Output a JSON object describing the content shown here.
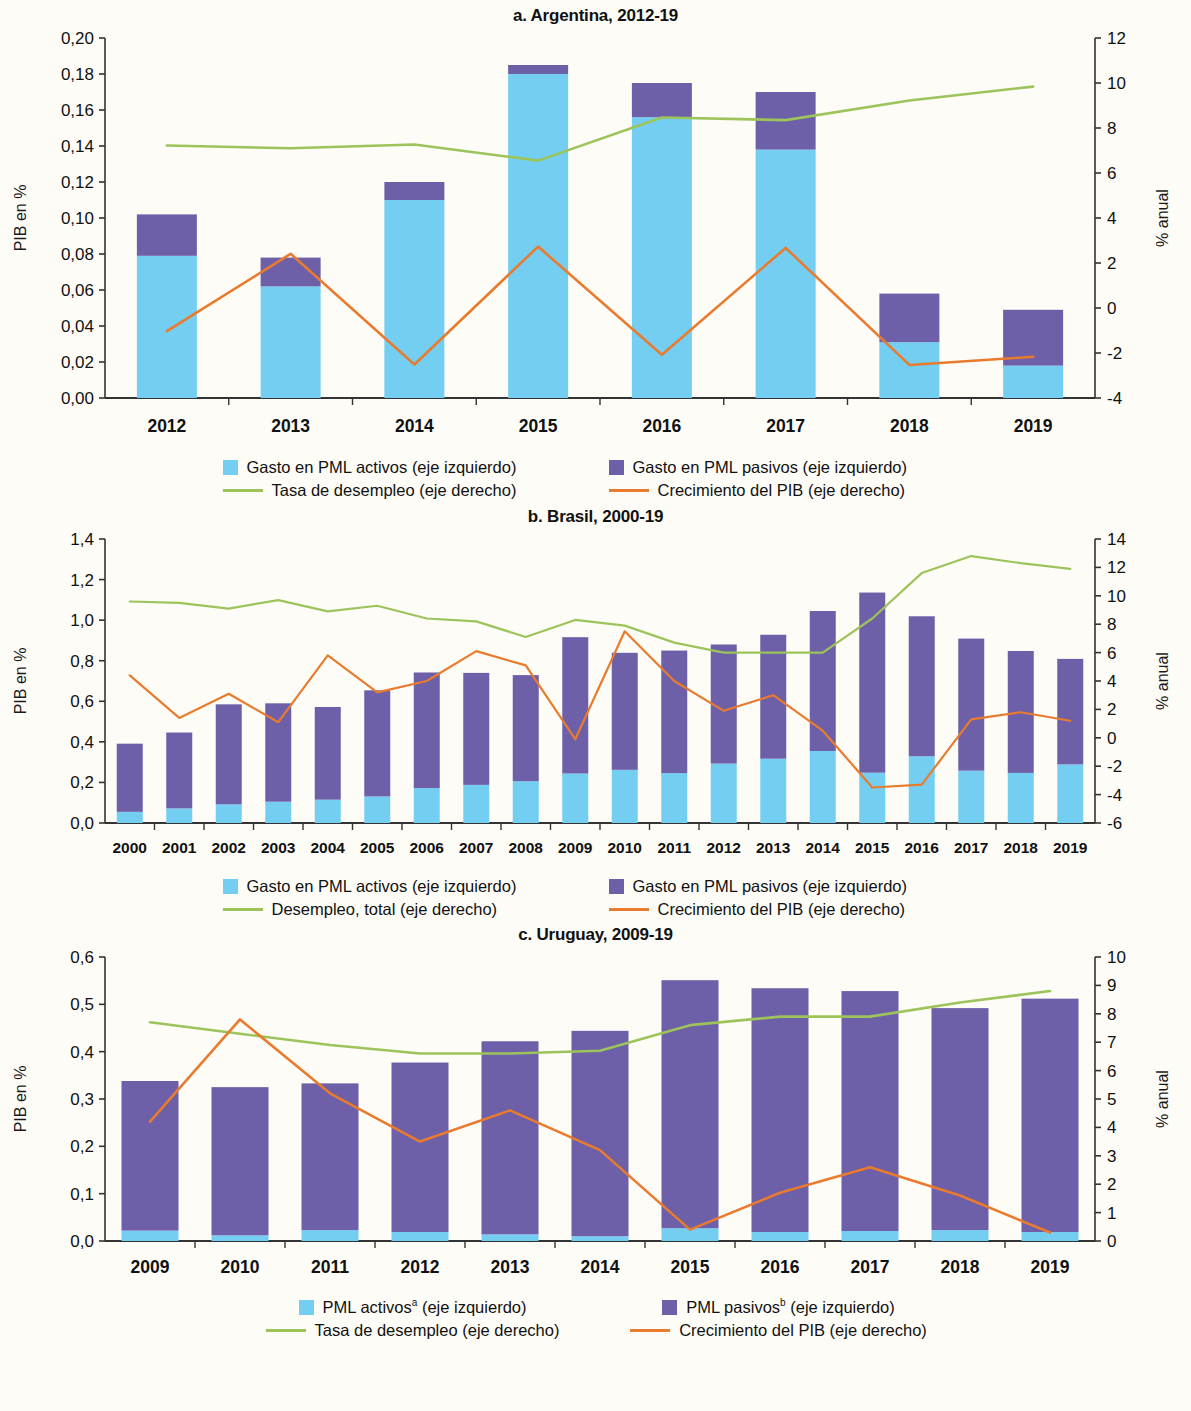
{
  "colors": {
    "pml_activos": "#74CEF2",
    "pml_pasivos": "#6D5FA8",
    "desempleo": "#9CC45B",
    "crecimiento": "#E97B2E",
    "axis": "#333333",
    "background": "#FDFCF7"
  },
  "legend_common": {
    "activos_gasto": "Gasto en PML activos (eje izquierdo)",
    "pasivos_gasto": "Gasto en PML pasivos (eje izquierdo)",
    "tasa_desempleo": "Tasa de desempleo (eje derecho)",
    "desempleo_total": "Desempleo, total (eje derecho)",
    "crecimiento_pib": "Crecimiento del PIB (eje derecho)",
    "activos_pml": "PML activos",
    "pasivos_pml": "PML pasivos",
    "sup_a": "a",
    "sup_b": "b",
    "eje_izquierdo": " (eje izquierdo)"
  },
  "chart_data": [
    {
      "id": "argentina",
      "type": "bar",
      "title": "a. Argentina, 2012-19",
      "ylabel": "PIB en %",
      "ylabel_right": "% anual",
      "xlabel": "",
      "categories": [
        "2012",
        "2013",
        "2014",
        "2015",
        "2016",
        "2017",
        "2018",
        "2019"
      ],
      "ylim": [
        0,
        0.2
      ],
      "yticks": [
        "0,00",
        "0,02",
        "0,04",
        "0,06",
        "0,08",
        "0,10",
        "0,12",
        "0,14",
        "0,16",
        "0,18",
        "0,20"
      ],
      "ytick_values": [
        0,
        0.02,
        0.04,
        0.06,
        0.08,
        0.1,
        0.12,
        0.14,
        0.16,
        0.18,
        0.2
      ],
      "ylim_right": [
        -4,
        12
      ],
      "yticks_right": [
        "-4",
        "-2",
        "0",
        "2",
        "4",
        "6",
        "8",
        "10",
        "12"
      ],
      "ytick_values_right": [
        -4,
        -2,
        0,
        2,
        4,
        6,
        8,
        10,
        12
      ],
      "grid": false,
      "legend_position": "bottom",
      "series": [
        {
          "name": "Gasto en PML activos (eje izquierdo)",
          "type": "bar-segment",
          "axis": "left",
          "values": [
            0.079,
            0.062,
            0.11,
            0.18,
            0.156,
            0.138,
            0.031,
            0.018
          ]
        },
        {
          "name": "Gasto en PML pasivos (eje izquierdo)",
          "type": "bar-segment",
          "axis": "left",
          "values": [
            0.023,
            0.016,
            0.01,
            0.005,
            0.019,
            0.032,
            0.027,
            0.031
          ]
        },
        {
          "name": "Tasa de desempleo (eje derecho)",
          "type": "line",
          "axis": "right",
          "values": [
            7.22,
            7.1,
            7.27,
            6.55,
            8.47,
            8.35,
            9.22,
            9.84
          ]
        },
        {
          "name": "Crecimiento del PIB (eje derecho)",
          "type": "line",
          "axis": "right",
          "values": [
            -1.03,
            2.41,
            -2.51,
            2.73,
            -2.08,
            2.67,
            -2.53,
            -2.17
          ]
        }
      ]
    },
    {
      "id": "brasil",
      "type": "bar",
      "title": "b. Brasil, 2000-19",
      "ylabel": "PIB en %",
      "ylabel_right": "% anual",
      "xlabel": "",
      "categories": [
        "2000",
        "2001",
        "2002",
        "2003",
        "2004",
        "2005",
        "2006",
        "2007",
        "2008",
        "2009",
        "2010",
        "2011",
        "2012",
        "2013",
        "2014",
        "2015",
        "2016",
        "2017",
        "2018",
        "2019"
      ],
      "ylim": [
        0,
        1.4
      ],
      "yticks": [
        "0,0",
        "0,2",
        "0,4",
        "0,6",
        "0,8",
        "1,0",
        "1,2",
        "1,4"
      ],
      "ytick_values": [
        0,
        0.2,
        0.4,
        0.6,
        0.8,
        1.0,
        1.2,
        1.4
      ],
      "ylim_right": [
        -6,
        14
      ],
      "yticks_right": [
        "-6",
        "-4",
        "-2",
        "0",
        "2",
        "4",
        "6",
        "8",
        "10",
        "12",
        "14"
      ],
      "ytick_values_right": [
        -6,
        -4,
        -2,
        0,
        2,
        4,
        6,
        8,
        10,
        12,
        14
      ],
      "grid": false,
      "legend_position": "bottom",
      "series": [
        {
          "name": "Gasto en PML activos (eje izquierdo)",
          "type": "bar-segment",
          "axis": "left",
          "values": [
            0.055,
            0.072,
            0.092,
            0.105,
            0.115,
            0.131,
            0.172,
            0.188,
            0.206,
            0.244,
            0.262,
            0.246,
            0.293,
            0.317,
            0.355,
            0.248,
            0.329,
            0.258,
            0.247,
            0.289
          ]
        },
        {
          "name": "Gasto en PML pasivos (eje izquierdo)",
          "type": "bar-segment",
          "axis": "left",
          "values": [
            0.336,
            0.374,
            0.493,
            0.485,
            0.457,
            0.523,
            0.57,
            0.552,
            0.523,
            0.672,
            0.577,
            0.604,
            0.587,
            0.611,
            0.69,
            0.888,
            0.69,
            0.651,
            0.601,
            0.52
          ]
        },
        {
          "name": "Desempleo, total (eje derecho)",
          "type": "line",
          "axis": "right",
          "values": [
            9.6,
            9.5,
            9.1,
            9.7,
            8.9,
            9.3,
            8.4,
            8.2,
            7.1,
            8.3,
            7.9,
            6.7,
            6.0,
            6.0,
            6.0,
            8.4,
            11.6,
            12.8,
            12.3,
            11.9
          ]
        },
        {
          "name": "Crecimiento del PIB (eje derecho)",
          "type": "line",
          "axis": "right",
          "values": [
            4.4,
            1.4,
            3.1,
            1.1,
            5.8,
            3.2,
            4.0,
            6.1,
            5.1,
            -0.1,
            7.5,
            4.0,
            1.9,
            3.0,
            0.5,
            -3.5,
            -3.3,
            1.3,
            1.8,
            1.2
          ]
        }
      ]
    },
    {
      "id": "uruguay",
      "type": "bar",
      "title": "c. Uruguay, 2009-19",
      "ylabel": "PIB en %",
      "ylabel_right": "% anual",
      "xlabel": "",
      "categories": [
        "2009",
        "2010",
        "2011",
        "2012",
        "2013",
        "2014",
        "2015",
        "2016",
        "2017",
        "2018",
        "2019"
      ],
      "ylim": [
        0,
        0.6
      ],
      "yticks": [
        "0,0",
        "0,1",
        "0,2",
        "0,3",
        "0,4",
        "0,5",
        "0,6"
      ],
      "ytick_values": [
        0,
        0.1,
        0.2,
        0.3,
        0.4,
        0.5,
        0.6
      ],
      "ylim_right": [
        0,
        10
      ],
      "yticks_right": [
        "0",
        "1",
        "2",
        "3",
        "4",
        "5",
        "6",
        "7",
        "8",
        "9",
        "10"
      ],
      "ytick_values_right": [
        0,
        1,
        2,
        3,
        4,
        5,
        6,
        7,
        8,
        9,
        10
      ],
      "grid": false,
      "legend_position": "bottom",
      "series": [
        {
          "name": "PML activos (eje izquierdo)",
          "type": "bar-segment",
          "axis": "left",
          "values": [
            0.022,
            0.012,
            0.023,
            0.019,
            0.014,
            0.01,
            0.027,
            0.019,
            0.021,
            0.023,
            0.019
          ]
        },
        {
          "name": "PML pasivos (eje izquierdo)",
          "type": "bar-segment",
          "axis": "left",
          "values": [
            0.316,
            0.313,
            0.31,
            0.358,
            0.408,
            0.434,
            0.524,
            0.515,
            0.507,
            0.469,
            0.493
          ]
        },
        {
          "name": "Tasa de desempleo (eje derecho)",
          "type": "line",
          "axis": "right",
          "values": [
            7.7,
            7.3,
            6.9,
            6.6,
            6.6,
            6.7,
            7.6,
            7.9,
            7.9,
            8.4,
            8.8
          ]
        },
        {
          "name": "Crecimiento del PIB (eje derecho)",
          "type": "line",
          "axis": "right",
          "values": [
            4.2,
            7.8,
            5.2,
            3.5,
            4.6,
            3.2,
            0.4,
            1.7,
            2.6,
            1.6,
            0.3
          ]
        }
      ]
    }
  ]
}
